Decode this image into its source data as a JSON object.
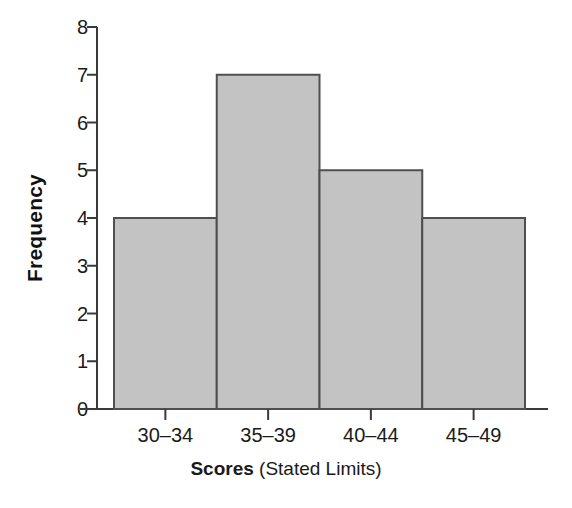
{
  "chart_data": {
    "type": "bar",
    "title": "",
    "subtitle": "",
    "xlabel_bold": "Scores",
    "xlabel_regular": " (Stated Limits)",
    "xlabel_full": "Scores (Stated Limits)",
    "ylabel": "Frequency",
    "categories": [
      "30–34",
      "35–39",
      "40–44",
      "45–49"
    ],
    "values": [
      4,
      7,
      5,
      4
    ],
    "ylim": [
      0,
      8
    ],
    "yticks": [
      0,
      1,
      2,
      3,
      4,
      5,
      6,
      7,
      8
    ],
    "ytick_labels": [
      "0",
      "1",
      "2",
      "3",
      "4",
      "5",
      "6",
      "7",
      "8"
    ],
    "grid": false,
    "legend": null,
    "bar_gap": 0,
    "colors": {
      "bar_fill": "#c3c3c3",
      "bar_edge": "#4f4f4f",
      "axis": "#3a3a3a",
      "text": "#1a1a1a",
      "background": "#ffffff"
    }
  },
  "axes": {
    "y_title": "Frequency",
    "x_title_bold": "Scores",
    "x_title_regular": " (Stated Limits)"
  }
}
